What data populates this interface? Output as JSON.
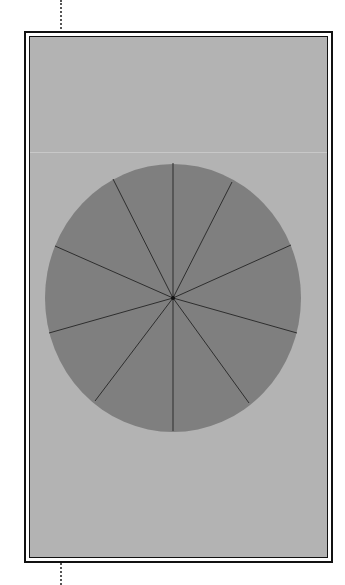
{
  "diagram": {
    "type": "pie",
    "shape": "ellipse",
    "center": {
      "x": 173,
      "y": 298
    },
    "radius": {
      "rx": 128,
      "ry": 134
    },
    "slice_count": 10,
    "fill_color": "#7f7f7f",
    "spoke_color": "#2e2e2e",
    "background_color": "#b3b3b3",
    "frame_color": "#111111",
    "spokes": [
      {
        "x": 173,
        "y": 163
      },
      {
        "x": 232,
        "y": 182
      },
      {
        "x": 291,
        "y": 245
      },
      {
        "x": 297,
        "y": 333
      },
      {
        "x": 249,
        "y": 403
      },
      {
        "x": 173,
        "y": 431
      },
      {
        "x": 95,
        "y": 401
      },
      {
        "x": 49,
        "y": 333
      },
      {
        "x": 55,
        "y": 246
      },
      {
        "x": 113,
        "y": 179
      }
    ]
  }
}
